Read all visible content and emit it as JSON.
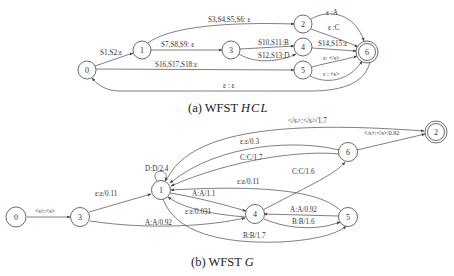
{
  "diagram_a": {
    "caption_prefix": "(a) WFST ",
    "caption_name": "HCL",
    "nodes": [
      {
        "id": "0",
        "final": false
      },
      {
        "id": "1",
        "final": false
      },
      {
        "id": "2",
        "final": false
      },
      {
        "id": "3",
        "final": false
      },
      {
        "id": "4",
        "final": false
      },
      {
        "id": "5",
        "final": false
      },
      {
        "id": "6",
        "final": true
      }
    ],
    "edges": [
      {
        "from": "0",
        "to": "1",
        "label": "S1,S2:ε"
      },
      {
        "from": "1",
        "to": "2",
        "label": "S3,S4,S5,S6: ε"
      },
      {
        "from": "1",
        "to": "3",
        "label": "S7,S8,S9: ε"
      },
      {
        "from": "3",
        "to": "4",
        "label": "S10,S11:B"
      },
      {
        "from": "3",
        "to": "4",
        "label": "S12,S13:D"
      },
      {
        "from": "0",
        "to": "5",
        "label": "S16,S17,S18:ε"
      },
      {
        "from": "2",
        "to": "6",
        "label": "ε :A"
      },
      {
        "from": "2",
        "to": "6",
        "label": "ε :C"
      },
      {
        "from": "4",
        "to": "6",
        "label": "S14,S15:ε"
      },
      {
        "from": "5",
        "to": "6",
        "label": "ε: </s>"
      },
      {
        "from": "5",
        "to": "6",
        "label": "ε : <s>"
      },
      {
        "from": "6",
        "to": "0",
        "label": "ε : ε"
      }
    ]
  },
  "diagram_b": {
    "caption_prefix": "(b) WFST ",
    "caption_name": "G",
    "nodes": [
      {
        "id": "0",
        "final": false
      },
      {
        "id": "1",
        "final": false
      },
      {
        "id": "2",
        "final": true
      },
      {
        "id": "3",
        "final": false
      },
      {
        "id": "4",
        "final": false
      },
      {
        "id": "5",
        "final": false
      },
      {
        "id": "6",
        "final": false
      }
    ],
    "edges": [
      {
        "from": "0",
        "to": "3",
        "label": "<s>:<s>"
      },
      {
        "from": "3",
        "to": "1",
        "label": "ε:ε/0.11"
      },
      {
        "from": "3",
        "to": "4",
        "label": "A:A/0.92"
      },
      {
        "from": "1",
        "to": "1",
        "label": "D:D/2.4"
      },
      {
        "from": "1",
        "to": "2",
        "label": "</s>:</s>/1.7"
      },
      {
        "from": "6",
        "to": "1",
        "label": "ε:ε/0.3"
      },
      {
        "from": "6",
        "to": "1",
        "label": "C:C/1.7"
      },
      {
        "from": "4",
        "to": "6",
        "label": "C:C/1.6"
      },
      {
        "from": "6",
        "to": "2",
        "label": "</s>:</s>/0.92"
      },
      {
        "from": "5",
        "to": "1",
        "label": "ε:ε/0.11"
      },
      {
        "from": "1",
        "to": "4",
        "label": "A:A/1.1"
      },
      {
        "from": "4",
        "to": "1",
        "label": "ε:ε/0.031"
      },
      {
        "from": "5",
        "to": "4",
        "label": "A:A/0.92"
      },
      {
        "from": "4",
        "to": "5",
        "label": "B:B/1.6"
      },
      {
        "from": "1",
        "to": "5",
        "label": "B:B/1.7"
      }
    ]
  }
}
